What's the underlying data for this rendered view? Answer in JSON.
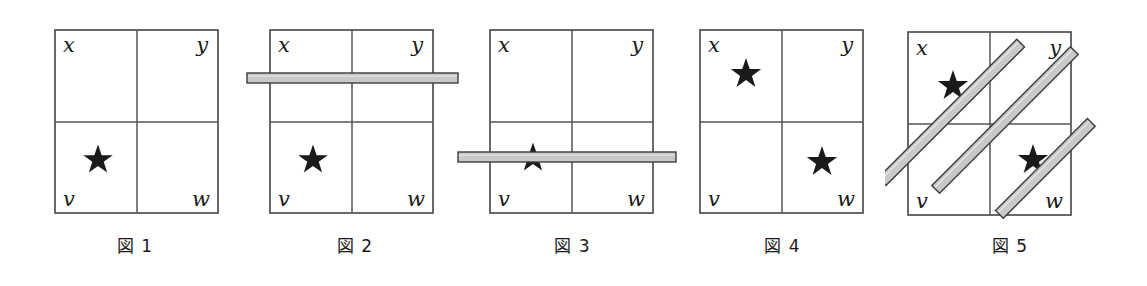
{
  "page": {
    "background_color": "#ffffff",
    "width": 1147,
    "height": 286
  },
  "style": {
    "grid_line_color": "#555555",
    "grid_border_color": "#444444",
    "star_color": "#1a1a1a",
    "bar_fill_color": "#c9c9c9",
    "bar_edge_color": "#3c3c3c",
    "label_color": "#1a1a1a",
    "caption_color": "#1a1a1a"
  },
  "figures": [
    {
      "id": "figure-1",
      "caption": "図 1",
      "cell_labels": {
        "top_left": "x",
        "top_right": "y",
        "bottom_left": "v",
        "bottom_right": "w"
      },
      "stars": [
        {
          "cell": "bottom_left",
          "label": "v",
          "occluded": false
        }
      ],
      "bars": []
    },
    {
      "id": "figure-2",
      "caption": "図 2",
      "cell_labels": {
        "top_left": "x",
        "top_right": "y",
        "bottom_left": "v",
        "bottom_right": "w"
      },
      "stars": [
        {
          "cell": "bottom_left",
          "label": "v",
          "occluded": false
        }
      ],
      "bars": [
        {
          "orientation": "horizontal",
          "position": "upper",
          "crosses_star": false
        }
      ]
    },
    {
      "id": "figure-3",
      "caption": "図 3",
      "cell_labels": {
        "top_left": "x",
        "top_right": "y",
        "bottom_left": "v",
        "bottom_right": "w"
      },
      "stars": [
        {
          "cell": "bottom_left",
          "label": "v",
          "occluded": true
        }
      ],
      "bars": [
        {
          "orientation": "horizontal",
          "position": "lower",
          "crosses_star": true
        }
      ]
    },
    {
      "id": "figure-4",
      "caption": "図 4",
      "cell_labels": {
        "top_left": "x",
        "top_right": "y",
        "bottom_left": "v",
        "bottom_right": "w"
      },
      "stars": [
        {
          "cell": "top_left",
          "label": "x",
          "occluded": false
        },
        {
          "cell": "bottom_right",
          "label": "w",
          "occluded": false
        }
      ],
      "bars": []
    },
    {
      "id": "figure-5",
      "caption": "図 5",
      "cell_labels": {
        "top_left": "x",
        "top_right": "y",
        "bottom_left": "v",
        "bottom_right": "w"
      },
      "stars": [
        {
          "cell": "top_left",
          "label": "x",
          "occluded": true
        },
        {
          "cell": "bottom_right",
          "label": "w",
          "occluded": true
        }
      ],
      "bars": [
        {
          "orientation": "diagonal",
          "position": "left",
          "crosses_star": true
        },
        {
          "orientation": "diagonal",
          "position": "center",
          "crosses_star": false
        },
        {
          "orientation": "diagonal",
          "position": "right",
          "crosses_star": true
        }
      ]
    }
  ]
}
